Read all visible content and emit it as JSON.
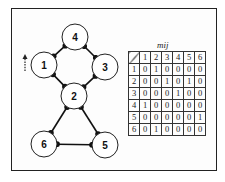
{
  "graph": {
    "nodes": [
      {
        "id": "1",
        "label": "1",
        "cx": 44,
        "cy": 65
      },
      {
        "id": "2",
        "label": "2",
        "cx": 74,
        "cy": 96
      },
      {
        "id": "3",
        "label": "3",
        "cx": 105,
        "cy": 67
      },
      {
        "id": "4",
        "label": "4",
        "cx": 75,
        "cy": 37
      },
      {
        "id": "5",
        "label": "5",
        "cx": 105,
        "cy": 145
      },
      {
        "id": "6",
        "label": "6",
        "cx": 44,
        "cy": 144
      }
    ],
    "edges": [
      {
        "from": "1",
        "to": "2"
      },
      {
        "from": "2",
        "to": "3"
      },
      {
        "from": "2",
        "to": "5"
      },
      {
        "from": "3",
        "to": "4"
      },
      {
        "from": "4",
        "to": "1"
      },
      {
        "from": "5",
        "to": "6"
      },
      {
        "from": "6",
        "to": "2"
      }
    ],
    "indicator": "dashed-up-arrow"
  },
  "matrix": {
    "title": "mij",
    "column_headers": [
      "1",
      "2",
      "3",
      "4",
      "5",
      "6"
    ],
    "rows": [
      {
        "label": "1",
        "values": [
          "0",
          "1",
          "0",
          "0",
          "0",
          "0"
        ]
      },
      {
        "label": "2",
        "values": [
          "0",
          "0",
          "1",
          "0",
          "1",
          "0"
        ]
      },
      {
        "label": "3",
        "values": [
          "0",
          "0",
          "0",
          "1",
          "0",
          "0"
        ]
      },
      {
        "label": "4",
        "values": [
          "1",
          "0",
          "0",
          "0",
          "0",
          "0"
        ]
      },
      {
        "label": "5",
        "values": [
          "0",
          "0",
          "0",
          "0",
          "0",
          "1"
        ]
      },
      {
        "label": "6",
        "values": [
          "0",
          "1",
          "0",
          "0",
          "0",
          "0"
        ]
      }
    ]
  }
}
